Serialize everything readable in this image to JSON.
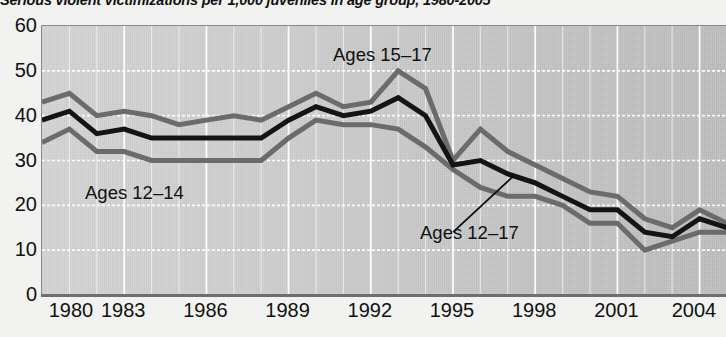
{
  "chart_title": "Serious violent victimizations per 1,000 juveniles in age group, 1980-2005",
  "axis": {
    "y_ticks": [
      "60",
      "50",
      "40",
      "30",
      "20",
      "10",
      "0"
    ],
    "x_ticks": [
      "1980",
      "1983",
      "1986",
      "1989",
      "1992",
      "1995",
      "1998",
      "2001",
      "2004"
    ]
  },
  "annotations": {
    "ages_15_17": "Ages 15–17",
    "ages_12_14": "Ages 12–14",
    "ages_12_17": "Ages 12–17"
  },
  "colors": {
    "plot_background": "#c9c9c9",
    "gridlines": "#ffffff",
    "series_ages_15_17": "#6b6b6b",
    "series_ages_12_17": "#141414",
    "series_ages_12_14": "#6b6b6b",
    "axis_line": "#6e6e6e",
    "page_background": "#f2f2f0",
    "text": "#111111"
  },
  "chart_data": {
    "type": "line",
    "title": "Serious violent victimizations per 1,000 juveniles in age group, 1980-2005",
    "xlabel": "",
    "ylabel": "",
    "xlim": [
      1980,
      2005
    ],
    "ylim": [
      0,
      60
    ],
    "ytick_step": 10,
    "xtick_step": 3,
    "grid": true,
    "legend": "inline-annotations",
    "x": [
      1980,
      1981,
      1982,
      1983,
      1984,
      1985,
      1986,
      1987,
      1988,
      1989,
      1990,
      1991,
      1992,
      1993,
      1994,
      1995,
      1996,
      1997,
      1998,
      1999,
      2000,
      2001,
      2002,
      2003,
      2004,
      2005
    ],
    "series": [
      {
        "name": "Ages 15–17",
        "color": "#6b6b6b",
        "values": [
          43,
          45,
          40,
          41,
          40,
          38,
          39,
          40,
          39,
          42,
          45,
          42,
          43,
          50,
          46,
          30,
          37,
          32,
          29,
          26,
          23,
          22,
          17,
          15,
          19,
          16
        ]
      },
      {
        "name": "Ages 12–17",
        "color": "#141414",
        "values": [
          39,
          41,
          36,
          37,
          35,
          35,
          35,
          35,
          35,
          39,
          42,
          40,
          41,
          44,
          40,
          29,
          30,
          27,
          25,
          22,
          19,
          19,
          14,
          13,
          17,
          15
        ]
      },
      {
        "name": "Ages 12–14",
        "color": "#6b6b6b",
        "values": [
          34,
          37,
          32,
          32,
          30,
          30,
          30,
          30,
          30,
          35,
          39,
          38,
          38,
          37,
          33,
          28,
          24,
          22,
          22,
          20,
          16,
          16,
          10,
          12,
          14,
          14
        ]
      }
    ]
  }
}
